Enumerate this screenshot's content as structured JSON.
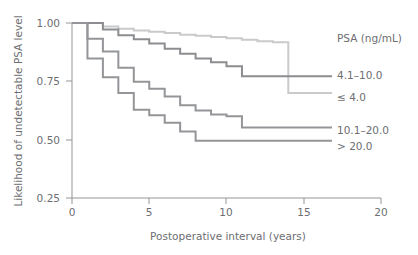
{
  "chart_data": {
    "type": "line",
    "subtype": "kaplan-meier-step",
    "title": "",
    "xlabel": "Postoperative interval (years)",
    "ylabel": "Likelihood of undetectable PSA level",
    "xlim": [
      0,
      20
    ],
    "ylim": [
      0.25,
      1.0
    ],
    "xticks": [
      0,
      5,
      10,
      15,
      20
    ],
    "xtick_labels": [
      "0",
      "5",
      "10",
      "15",
      "20"
    ],
    "yticks": [
      0.25,
      0.5,
      0.75,
      1.0
    ],
    "ytick_labels": [
      "0.25",
      "0.50",
      "0.75",
      "1.00"
    ],
    "grid": false,
    "legend_position": "right",
    "legend_title": "PSA (ng/mL)",
    "series": [
      {
        "name": "<= 4.0",
        "label": "≤ 4.0",
        "color": "#c9cacc",
        "x": [
          0,
          1,
          2,
          3,
          4,
          5,
          6,
          7,
          8,
          9,
          10,
          11,
          12,
          13,
          14,
          14
        ],
        "y": [
          1.0,
          1.0,
          0.985,
          0.975,
          0.968,
          0.962,
          0.957,
          0.95,
          0.945,
          0.94,
          0.935,
          0.928,
          0.922,
          0.918,
          0.915,
          0.7
        ]
      },
      {
        "name": "4.1-10.0",
        "label": "4.1–10.0",
        "color": "#8b8d90",
        "x": [
          0,
          1,
          2,
          3,
          4,
          5,
          6,
          7,
          8,
          9,
          10,
          11,
          14
        ],
        "y": [
          1.0,
          1.0,
          0.972,
          0.948,
          0.93,
          0.912,
          0.89,
          0.868,
          0.848,
          0.832,
          0.815,
          0.772,
          0.772
        ]
      },
      {
        "name": "10.1-20.0",
        "label": "10.1–20.0",
        "color": "#939598",
        "x": [
          0,
          1,
          2,
          3,
          4,
          5,
          6,
          7,
          8,
          9,
          10,
          11,
          14
        ],
        "y": [
          1.0,
          0.932,
          0.878,
          0.808,
          0.748,
          0.718,
          0.685,
          0.648,
          0.625,
          0.608,
          0.6,
          0.552,
          0.552
        ]
      },
      {
        "name": "> 20.0",
        "label": "> 20.0",
        "color": "#939598",
        "x": [
          0,
          1,
          2,
          3,
          4,
          5,
          6,
          7,
          8,
          14
        ],
        "y": [
          1.0,
          0.848,
          0.768,
          0.7,
          0.628,
          0.605,
          0.572,
          0.535,
          0.495,
          0.495
        ]
      }
    ]
  },
  "legend": {
    "title": "PSA (ng/mL)",
    "entries": [
      {
        "label": "4.1–10.0",
        "color": "#8b8d90"
      },
      {
        "label": "≤ 4.0",
        "color": "#c9cacc"
      },
      {
        "label": "10.1–20.0",
        "color": "#939598"
      },
      {
        "label": "> 20.0",
        "color": "#939598"
      }
    ]
  },
  "colors": {
    "axis": "#939598",
    "text": "#6d6e71",
    "background": "#ffffff"
  }
}
